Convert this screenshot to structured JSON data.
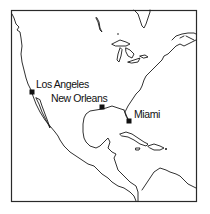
{
  "map": {
    "type": "outline-map",
    "region": "North America, Gulf of Mexico and Caribbean",
    "frame_color": "#2a2a2a",
    "coast_color": "#1a1a1a",
    "marker_color": "#111111",
    "cities": [
      {
        "name": "Los Angeles",
        "marker_x": 32,
        "marker_y": 92,
        "label_x": 36,
        "label_y": 79
      },
      {
        "name": "New Orleans",
        "marker_x": 102,
        "marker_y": 107,
        "label_x": 51,
        "label_y": 93
      },
      {
        "name": "Miami",
        "marker_x": 129,
        "marker_y": 121,
        "label_x": 134,
        "label_y": 109
      }
    ]
  }
}
